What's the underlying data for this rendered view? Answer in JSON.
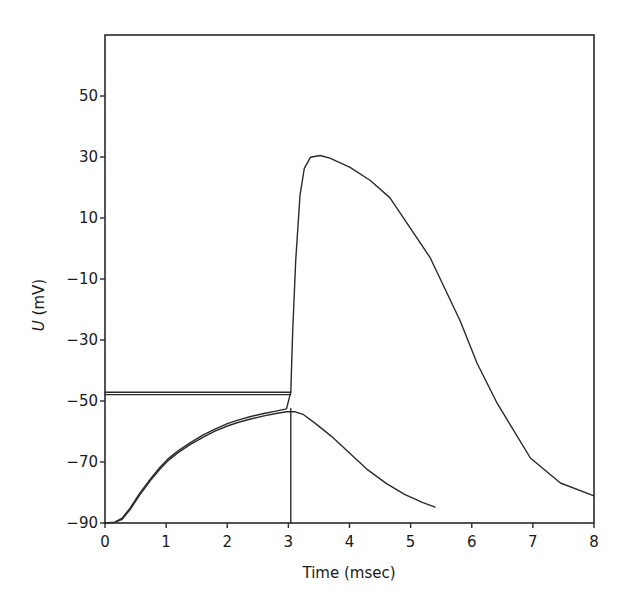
{
  "header_fragment": "",
  "chart_data": {
    "type": "line",
    "title": "",
    "xlabel": "Time (msec)",
    "ylabel_italic": "U",
    "ylabel_rest": " (mV)",
    "xlim": [
      0,
      8
    ],
    "ylim": [
      -90,
      70
    ],
    "grid": false,
    "legend": null,
    "x_ticks": [
      0,
      1,
      2,
      3,
      4,
      5,
      6,
      7,
      8
    ],
    "x_tick_labels": [
      "0",
      "1",
      "2",
      "3",
      "4",
      "5",
      "6",
      "7",
      "8"
    ],
    "y_ticks": [
      50,
      30,
      10,
      -10,
      -30,
      -50,
      -70,
      -90
    ],
    "y_tick_labels": [
      "50",
      "30",
      "10",
      "−10",
      "−30",
      "−50",
      "−70",
      "−90"
    ],
    "line_color": "#2a2a2a",
    "series": [
      {
        "name": "action-potential",
        "x": [
          0.0,
          0.16,
          0.28,
          0.41,
          0.57,
          0.74,
          0.9,
          1.03,
          1.19,
          1.39,
          1.6,
          1.8,
          2.0,
          2.2,
          2.4,
          2.6,
          2.8,
          2.97,
          3.04,
          3.07,
          3.12,
          3.19,
          3.26,
          3.36,
          3.52,
          3.68,
          4.01,
          4.34,
          4.66,
          5.32,
          5.81,
          6.09,
          6.42,
          6.96,
          7.45,
          8.0
        ],
        "y": [
          -90.0,
          -89.7,
          -88.4,
          -85.1,
          -80.2,
          -75.6,
          -71.7,
          -69.0,
          -66.4,
          -63.7,
          -61.2,
          -59.2,
          -57.4,
          -56.1,
          -55.0,
          -54.1,
          -53.3,
          -52.6,
          -47.0,
          -27.0,
          -4.0,
          17.4,
          26.3,
          29.9,
          30.5,
          29.6,
          26.6,
          22.3,
          16.7,
          -3.0,
          -23.7,
          -37.8,
          -50.9,
          -68.7,
          -76.9,
          -81.1
        ]
      },
      {
        "name": "subthreshold-response",
        "x": [
          0.0,
          0.16,
          0.28,
          0.41,
          0.57,
          0.74,
          0.9,
          1.03,
          1.19,
          1.39,
          1.6,
          1.8,
          2.0,
          2.2,
          2.4,
          2.6,
          2.8,
          2.97,
          3.1,
          3.25,
          3.45,
          3.7,
          4.0,
          4.3,
          4.6,
          4.9,
          5.2,
          5.4
        ],
        "y": [
          -90.0,
          -89.8,
          -88.8,
          -85.6,
          -80.8,
          -76.2,
          -72.3,
          -69.6,
          -67.0,
          -64.3,
          -61.9,
          -59.9,
          -58.2,
          -56.9,
          -55.8,
          -54.9,
          -54.1,
          -53.5,
          -53.5,
          -54.5,
          -57.5,
          -61.5,
          -67.0,
          -72.6,
          -77.0,
          -80.6,
          -83.3,
          -84.8
        ]
      },
      {
        "name": "threshold-line-upper",
        "x": [
          0.0,
          3.04
        ],
        "y": [
          -47.1,
          -47.1
        ]
      },
      {
        "name": "threshold-line-lower",
        "x": [
          0.0,
          3.04
        ],
        "y": [
          -47.9,
          -47.9
        ]
      },
      {
        "name": "stimulus-marker",
        "x": [
          3.04,
          3.04
        ],
        "y": [
          -90.0,
          -52.5
        ]
      }
    ]
  }
}
